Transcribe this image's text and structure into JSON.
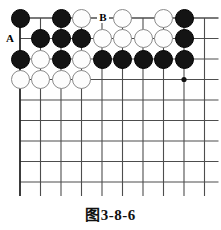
{
  "figure": {
    "caption": "图3-8-6",
    "kind": "go-board-diagram"
  },
  "board": {
    "columns": 10,
    "rows": 9,
    "origin_x": 20,
    "origin_y": 18,
    "spacing": 20.5,
    "line_color": "#4d4d4d",
    "edge_line_color": "#262626",
    "black_color": "#141414",
    "white_color": "#fdfdfd",
    "white_border_color": "#8a8a8a",
    "stone_diameter": 19,
    "star_points": [
      {
        "col": 9,
        "row": 4
      }
    ],
    "stones": [
      {
        "col": 1,
        "row": 1,
        "color": "black"
      },
      {
        "col": 3,
        "row": 1,
        "color": "black"
      },
      {
        "col": 4,
        "row": 1,
        "color": "white"
      },
      {
        "col": 6,
        "row": 1,
        "color": "white"
      },
      {
        "col": 8,
        "row": 1,
        "color": "white"
      },
      {
        "col": 9,
        "row": 1,
        "color": "black"
      },
      {
        "col": 2,
        "row": 2,
        "color": "black"
      },
      {
        "col": 3,
        "row": 2,
        "color": "black"
      },
      {
        "col": 4,
        "row": 2,
        "color": "black"
      },
      {
        "col": 5,
        "row": 2,
        "color": "white"
      },
      {
        "col": 6,
        "row": 2,
        "color": "white"
      },
      {
        "col": 7,
        "row": 2,
        "color": "white"
      },
      {
        "col": 8,
        "row": 2,
        "color": "white"
      },
      {
        "col": 9,
        "row": 2,
        "color": "black"
      },
      {
        "col": 1,
        "row": 3,
        "color": "black"
      },
      {
        "col": 2,
        "row": 3,
        "color": "white"
      },
      {
        "col": 3,
        "row": 3,
        "color": "black"
      },
      {
        "col": 4,
        "row": 3,
        "color": "white"
      },
      {
        "col": 5,
        "row": 3,
        "color": "black"
      },
      {
        "col": 6,
        "row": 3,
        "color": "black"
      },
      {
        "col": 7,
        "row": 3,
        "color": "black"
      },
      {
        "col": 8,
        "row": 3,
        "color": "black"
      },
      {
        "col": 9,
        "row": 3,
        "color": "black"
      },
      {
        "col": 1,
        "row": 4,
        "color": "white"
      },
      {
        "col": 2,
        "row": 4,
        "color": "white"
      },
      {
        "col": 3,
        "row": 4,
        "color": "white"
      },
      {
        "col": 4,
        "row": 4,
        "color": "white"
      }
    ],
    "point_labels": [
      {
        "text": "A",
        "col": 1,
        "row": 2,
        "offset_x": -11,
        "offset_y": 0
      },
      {
        "text": "B",
        "col": 5,
        "row": 1,
        "offset_x": 0,
        "offset_y": 0
      }
    ]
  }
}
